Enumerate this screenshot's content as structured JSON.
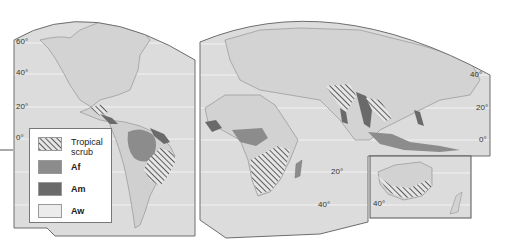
{
  "figure": {
    "type": "world map"
  },
  "colors": {
    "background": "#ffffff",
    "land": "#d6d6d6",
    "ocean_panel": "#e1e1e1",
    "coast": "#8a8a8a",
    "graticule": "#f4f4f4",
    "af": "#8c8c8c",
    "am": "#6a6a6a",
    "aw": "#ececec",
    "hatch": "#3a3a3a",
    "border": "#6e6e6e"
  },
  "latitude_labels": {
    "left": [
      "60°",
      "40°",
      "20°",
      "0°"
    ],
    "right": [
      "40°",
      "20°",
      "0°"
    ],
    "africa": [
      "20°",
      "40°"
    ],
    "australia": [
      "40°"
    ]
  },
  "legend": {
    "items": [
      {
        "key": "tropical_scrub",
        "label_line1": "Tropical",
        "label_line2": "scrub",
        "pattern": "hatched"
      },
      {
        "key": "af",
        "label": "Af"
      },
      {
        "key": "am",
        "label": "Am"
      },
      {
        "key": "aw",
        "label": "Aw"
      }
    ]
  }
}
